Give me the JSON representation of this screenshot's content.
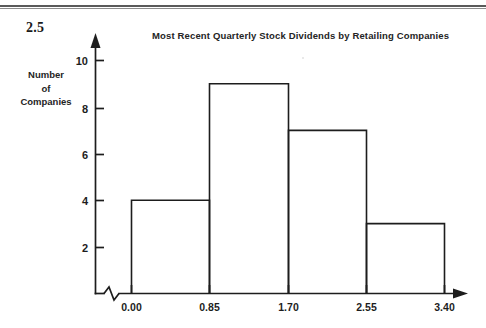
{
  "page": {
    "exercise_number": "2.5",
    "background_color": "#ffffff",
    "ink_color": "#1d1d1d"
  },
  "chart_data": {
    "type": "bar",
    "title": "Most Recent Quarterly Stock Dividends by Retailing Companies",
    "xlabel": "",
    "ylabel_lines": [
      "Number",
      "of",
      "Companies"
    ],
    "ylabel": "Number of Companies",
    "histogram": true,
    "bin_edges": [
      0.0,
      0.85,
      1.7,
      2.55,
      3.4
    ],
    "bin_edge_labels": [
      "0.00",
      "0.85",
      "1.70",
      "2.55",
      "3.40"
    ],
    "categories": [
      "0.00-0.85",
      "0.85-1.70",
      "1.70-2.55",
      "2.55-3.40"
    ],
    "values": [
      4,
      9,
      7,
      3
    ],
    "ylim": [
      0,
      10
    ],
    "yticks": [
      2,
      4,
      6,
      8,
      10
    ],
    "ytick_labels": [
      "2",
      "4",
      "6",
      "8",
      "10"
    ],
    "grid": false,
    "legend": null,
    "x_axis_break": true,
    "x_axis_arrow": true,
    "y_axis_arrow": true
  },
  "axis_labels": {
    "y": [
      "10",
      "8",
      "6",
      "4",
      "2"
    ],
    "x": [
      "0.00",
      "0.85",
      "1.70",
      "2.55",
      "3.40"
    ]
  }
}
